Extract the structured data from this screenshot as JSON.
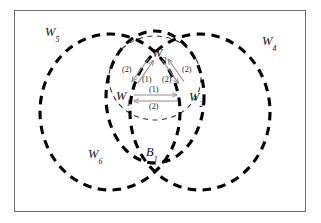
{
  "figure": {
    "type": "venn-diagram-with-state-transition-graph",
    "frame": {
      "border_color": "#6e6e6e"
    },
    "colors": {
      "thick_dash": "#000000",
      "thin_dash": "#2b2b2b",
      "arrow": "#8c8c8c",
      "text": "#111111",
      "frame": "#6e6e6e",
      "background": "#ffffff"
    },
    "regions": [
      {
        "id": "w5",
        "label_base": "W",
        "label_sub": "5",
        "x": 45,
        "y": 26
      },
      {
        "id": "w4",
        "label_base": "W",
        "label_sub": "4",
        "x": 262,
        "y": 35
      },
      {
        "id": "w6",
        "label_base": "W",
        "label_sub": "6",
        "x": 88,
        "y": 148
      },
      {
        "id": "b1",
        "label_base": "B",
        "label_sub": "1",
        "x": 146,
        "y": 146
      }
    ],
    "nodes": [
      {
        "id": "w3",
        "label_base": "W",
        "label_sub": "3",
        "x": 152,
        "y": 47
      },
      {
        "id": "w1",
        "label_base": "W",
        "label_sub": "1",
        "x": 116,
        "y": 90
      },
      {
        "id": "w2",
        "label_base": "W",
        "label_sub": "2",
        "x": 189,
        "y": 91
      }
    ],
    "edge_labels": [
      {
        "id": "w1-w3-outer",
        "text": "(2)",
        "x": 122,
        "y": 66
      },
      {
        "id": "w1-w3-inner",
        "text": "(1)",
        "x": 142,
        "y": 76
      },
      {
        "id": "w3-w2-inner",
        "text": "(2)",
        "x": 162,
        "y": 76
      },
      {
        "id": "w3-w2-outer",
        "text": "(2)",
        "x": 182,
        "y": 66
      },
      {
        "id": "w1-w2-top",
        "text": "(1)",
        "x": 149,
        "y": 86
      },
      {
        "id": "w1-w2-bottom",
        "text": "(2)",
        "x": 149,
        "y": 103
      }
    ],
    "circles": [
      {
        "id": "left-circle-w5-w6",
        "cx": 110,
        "cy": 112,
        "rx": 70,
        "ry": 78,
        "weight": "thick"
      },
      {
        "id": "right-circle-w4",
        "cx": 200,
        "cy": 112,
        "rx": 70,
        "ry": 78,
        "weight": "thick"
      },
      {
        "id": "center-circle-b1",
        "cx": 155,
        "cy": 97,
        "rx": 49,
        "ry": 66,
        "weight": "thick"
      },
      {
        "id": "inner-triangle-circle",
        "cx": 155,
        "cy": 78,
        "rx": 46,
        "ry": 42,
        "weight": "thin"
      }
    ]
  }
}
